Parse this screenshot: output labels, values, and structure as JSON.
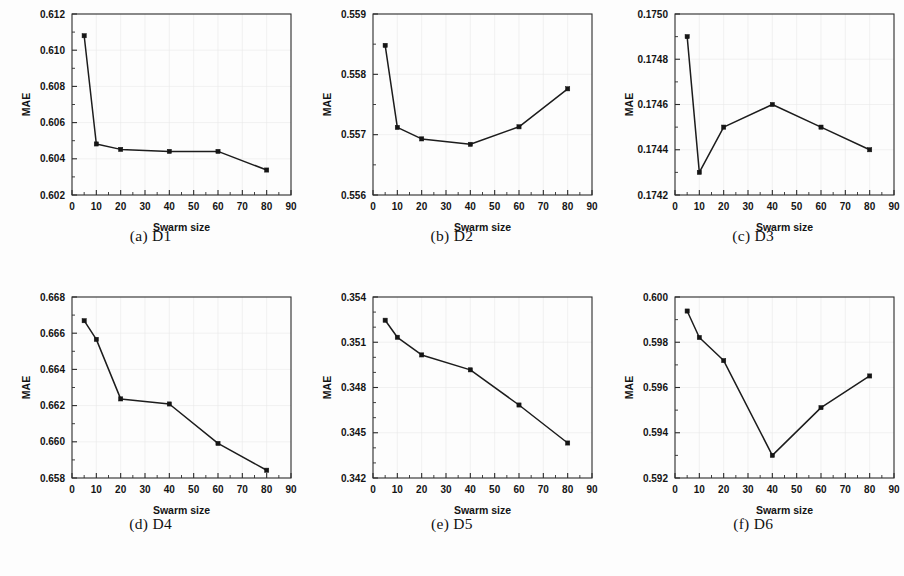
{
  "figure": {
    "axis_titles": {
      "x": "Swarm size",
      "y": "MAE"
    },
    "x_ticks": [
      "0",
      "10",
      "20",
      "30",
      "40",
      "50",
      "60",
      "70",
      "80",
      "90"
    ],
    "colors": {
      "line": "#1c1c1c",
      "marker": "#151515",
      "frame": "#2b2b2b",
      "grid": "#e9e9e9",
      "background": "#fdfdfd"
    },
    "captions": [
      "(a) D1",
      "(b) D2",
      "(c) D3",
      "(d) D4",
      "(e) D5",
      "(f) D6"
    ]
  },
  "chart_data": [
    {
      "type": "line",
      "title": "(a) D1",
      "xlabel": "Swarm size",
      "ylabel": "MAE",
      "x": [
        5,
        10,
        20,
        40,
        60,
        80
      ],
      "values": [
        0.6108,
        0.60482,
        0.60452,
        0.60441,
        0.60441,
        0.60338
      ],
      "xlim": [
        0,
        90
      ],
      "ylim": [
        0.602,
        0.612
      ],
      "xticks": [
        0,
        10,
        20,
        30,
        40,
        50,
        60,
        70,
        80,
        90
      ],
      "yticks": [
        0.602,
        0.604,
        0.606,
        0.608,
        0.61,
        0.612
      ],
      "ytick_labels": [
        "0.602",
        "0.604",
        "0.606",
        "0.608",
        "0.610",
        "0.612"
      ],
      "y_minor_per_major": 2,
      "grid": "faint",
      "legend": "none"
    },
    {
      "type": "line",
      "title": "(b) D2",
      "xlabel": "Swarm size",
      "ylabel": "MAE",
      "x": [
        5,
        10,
        20,
        40,
        60,
        80
      ],
      "values": [
        0.55848,
        0.55712,
        0.55693,
        0.55684,
        0.55713,
        0.55776
      ],
      "xlim": [
        0,
        90
      ],
      "ylim": [
        0.556,
        0.559
      ],
      "xticks": [
        0,
        10,
        20,
        30,
        40,
        50,
        60,
        70,
        80,
        90
      ],
      "yticks": [
        0.556,
        0.557,
        0.558,
        0.559
      ],
      "ytick_labels": [
        "0.556",
        "0.557",
        "0.558",
        "0.559"
      ],
      "y_minor_per_major": 2,
      "grid": "faint",
      "legend": "none"
    },
    {
      "type": "line",
      "title": "(c) D3",
      "xlabel": "Swarm size",
      "ylabel": "MAE",
      "x": [
        5,
        10,
        20,
        40,
        60,
        80
      ],
      "values": [
        0.1749,
        0.1743,
        0.1745,
        0.1746,
        0.1745,
        0.1744
      ],
      "xlim": [
        0,
        90
      ],
      "ylim": [
        0.1742,
        0.175
      ],
      "xticks": [
        0,
        10,
        20,
        30,
        40,
        50,
        60,
        70,
        80,
        90
      ],
      "yticks": [
        0.1742,
        0.1744,
        0.1746,
        0.1748,
        0.175
      ],
      "ytick_labels": [
        "0.1742",
        "0.1744",
        "0.1746",
        "0.1748",
        "0.1750"
      ],
      "y_minor_per_major": 2,
      "grid": "faint",
      "legend": "none"
    },
    {
      "type": "line",
      "title": "(d) D4",
      "xlabel": "Swarm size",
      "ylabel": "MAE",
      "x": [
        5,
        10,
        20,
        40,
        60,
        80
      ],
      "values": [
        0.66669,
        0.66566,
        0.66237,
        0.66209,
        0.65991,
        0.65843
      ],
      "xlim": [
        0,
        90
      ],
      "ylim": [
        0.658,
        0.668
      ],
      "xticks": [
        0,
        10,
        20,
        30,
        40,
        50,
        60,
        70,
        80,
        90
      ],
      "yticks": [
        0.658,
        0.66,
        0.662,
        0.664,
        0.666,
        0.668
      ],
      "ytick_labels": [
        "0.658",
        "0.660",
        "0.662",
        "0.664",
        "0.666",
        "0.668"
      ],
      "y_minor_per_major": 2,
      "grid": "faint",
      "legend": "none"
    },
    {
      "type": "line",
      "title": "(e) D5",
      "xlabel": "Swarm size",
      "ylabel": "MAE",
      "x": [
        5,
        10,
        20,
        40,
        60,
        80
      ],
      "values": [
        0.35246,
        0.35133,
        0.35016,
        0.34917,
        0.34684,
        0.34432
      ],
      "xlim": [
        0,
        90
      ],
      "ylim": [
        0.342,
        0.354
      ],
      "xticks": [
        0,
        10,
        20,
        30,
        40,
        50,
        60,
        70,
        80,
        90
      ],
      "yticks": [
        0.342,
        0.345,
        0.348,
        0.351,
        0.354
      ],
      "ytick_labels": [
        "0.342",
        "0.345",
        "0.348",
        "0.351",
        "0.354"
      ],
      "y_minor_per_major": 3,
      "grid": "faint",
      "legend": "none"
    },
    {
      "type": "line",
      "title": "(f) D6",
      "xlabel": "Swarm size",
      "ylabel": "MAE",
      "x": [
        5,
        10,
        20,
        40,
        60,
        80
      ],
      "values": [
        0.59938,
        0.59821,
        0.59719,
        0.593,
        0.59511,
        0.59651
      ],
      "xlim": [
        0,
        90
      ],
      "ylim": [
        0.592,
        0.6
      ],
      "xticks": [
        0,
        10,
        20,
        30,
        40,
        50,
        60,
        70,
        80,
        90
      ],
      "yticks": [
        0.592,
        0.594,
        0.596,
        0.598,
        0.6
      ],
      "ytick_labels": [
        "0.592",
        "0.594",
        "0.596",
        "0.598",
        "0.600"
      ],
      "y_minor_per_major": 2,
      "grid": "faint",
      "legend": "none"
    }
  ]
}
